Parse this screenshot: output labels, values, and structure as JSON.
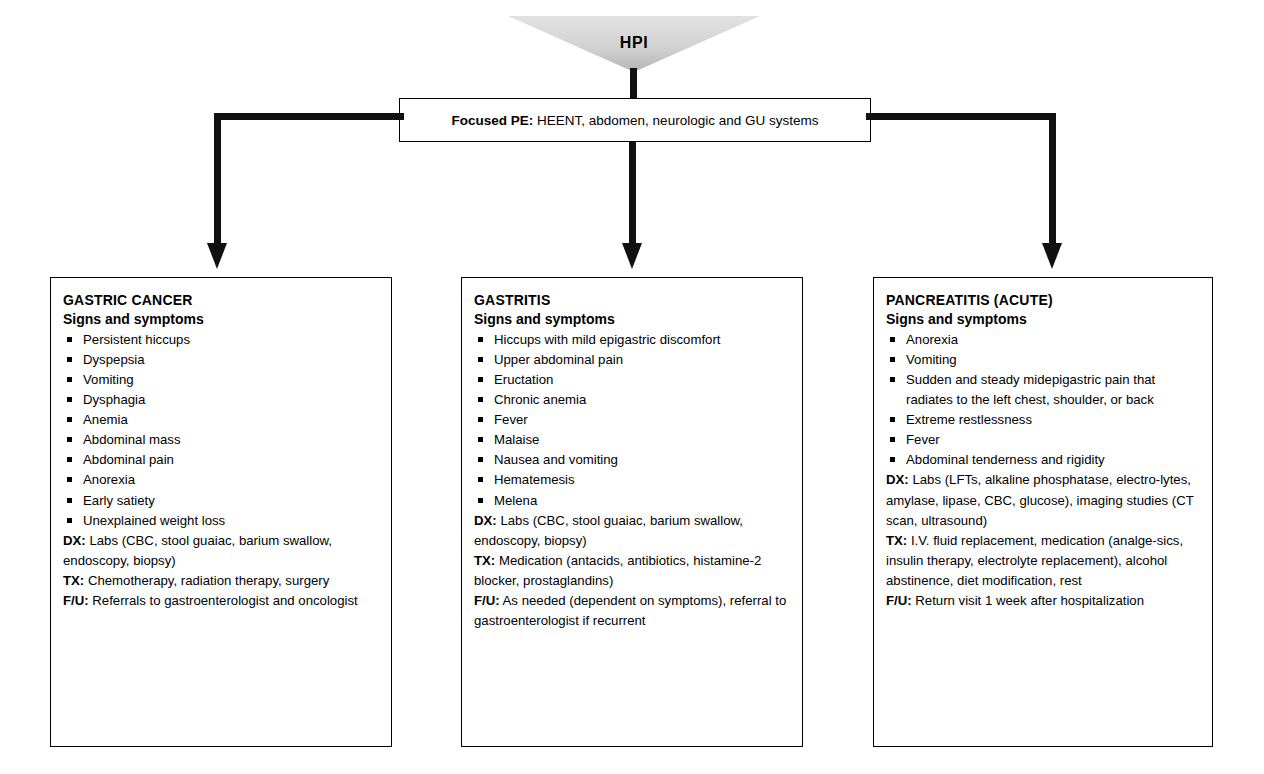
{
  "diagram": {
    "colors": {
      "line": "#111111",
      "box_border": "#000000",
      "funnel_fill_light": "#d9d9d9",
      "funnel_fill_dark": "#b3b3b3",
      "background": "#ffffff"
    }
  },
  "hpi": {
    "label": "HPI",
    "icon": "funnel-shape"
  },
  "focused_pe": {
    "lead": "Focused PE:",
    "body": "HEENT, abdomen, neurologic and GU systems"
  },
  "branches": [
    {
      "id": "gastric-cancer",
      "title": "GASTRIC CANCER",
      "subtitle": "Signs and symptoms",
      "symptoms": [
        "Persistent hiccups",
        "Dyspepsia",
        "Vomiting",
        "Dysphagia",
        "Anemia",
        "Abdominal mass",
        "Abdominal pain",
        "Anorexia",
        "Early satiety",
        "Unexplained weight loss"
      ],
      "plan": [
        {
          "key": "DX:",
          "text": "Labs (CBC, stool guaiac, barium swallow, endoscopy, biopsy)"
        },
        {
          "key": "TX:",
          "text": "Chemotherapy, radiation therapy, surgery"
        },
        {
          "key": "F/U:",
          "text": "Referrals to gastroenterologist and oncologist"
        }
      ]
    },
    {
      "id": "gastritis",
      "title": "GASTRITIS",
      "subtitle": "Signs and symptoms",
      "symptoms": [
        "Hiccups with mild epigastric discomfort",
        "Upper abdominal pain",
        "Eructation",
        "Chronic anemia",
        "Fever",
        "Malaise",
        "Nausea and vomiting",
        "Hematemesis",
        "Melena"
      ],
      "plan": [
        {
          "key": "DX:",
          "text": "Labs (CBC, stool guaiac, barium swallow, endoscopy, biopsy)"
        },
        {
          "key": "TX:",
          "text": "Medication (antacids, antibiotics, histamine-2 blocker, prostaglandins)"
        },
        {
          "key": "F/U:",
          "text": "As needed (dependent on symptoms), referral to gastroenterologist if recurrent"
        }
      ]
    },
    {
      "id": "pancreatitis",
      "title": "PANCREATITIS (ACUTE)",
      "subtitle": "Signs and symptoms",
      "symptoms": [
        "Anorexia",
        "Vomiting",
        "Sudden and steady midepigastric pain that radiates to the left chest, shoulder, or back",
        "Extreme restlessness",
        "Fever",
        "Abdominal tenderness and rigidity"
      ],
      "plan": [
        {
          "key": "DX:",
          "text": "Labs (LFTs, alkaline phosphatase, electro-lytes, amylase, lipase, CBC, glucose), imaging studies (CT scan, ultrasound)"
        },
        {
          "key": "TX:",
          "text": "I.V. fluid replacement, medication (analge-sics, insulin therapy, electrolyte replacement), alcohol abstinence, diet modification, rest"
        },
        {
          "key": "F/U:",
          "text": "Return visit 1 week after hospitalization"
        }
      ]
    }
  ]
}
